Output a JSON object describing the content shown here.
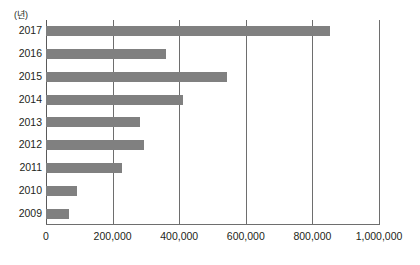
{
  "chart_data": {
    "type": "bar",
    "orientation": "horizontal",
    "title": "",
    "unit_label": "(년)",
    "xlabel": "",
    "ylabel": "",
    "categories": [
      "2017",
      "2016",
      "2015",
      "2014",
      "2013",
      "2012",
      "2011",
      "2010",
      "2009"
    ],
    "values": [
      854000,
      361000,
      544000,
      410000,
      283000,
      295000,
      229000,
      94000,
      70000
    ],
    "xlim": [
      0,
      1000000
    ],
    "xticks": [
      0,
      200000,
      400000,
      600000,
      800000,
      1000000
    ],
    "xticklabels": [
      "0",
      "200,000",
      "400,000",
      "600,000",
      "800,000",
      "1,000,000"
    ],
    "grid": "vertical",
    "legend": "none",
    "series": [
      {
        "name": "",
        "color": "#808080",
        "values": [
          854000,
          361000,
          544000,
          410000,
          283000,
          295000,
          229000,
          94000,
          70000
        ]
      }
    ]
  },
  "colors": {
    "bar": "#808080",
    "gridline": "#6e6e6e",
    "text": "#231f20",
    "background": "#ffffff"
  }
}
